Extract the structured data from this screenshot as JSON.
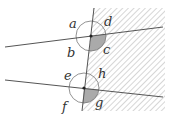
{
  "diagram": {
    "type": "parallel-lines-transversal-angles",
    "angle_labels": {
      "upper": [
        "a",
        "b",
        "c",
        "d"
      ],
      "lower": [
        "e",
        "f",
        "g",
        "h"
      ]
    },
    "shaded_angles": [
      "c",
      "g"
    ],
    "hatched_region": "right of transversal",
    "colors": {
      "line": "#555555",
      "shade": "#aaaaaa",
      "hatch": "#999999"
    }
  },
  "labels": {
    "a": "a",
    "b": "b",
    "c": "c",
    "d": "d",
    "e": "e",
    "f": "f",
    "g": "g",
    "h": "h"
  }
}
